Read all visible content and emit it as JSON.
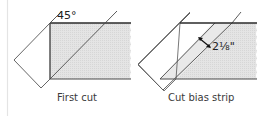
{
  "colors": {
    "line": "#4a4a4a",
    "thick_line": "#2a2a2a",
    "shade": "#e2e2e2",
    "rule": "#e6e6e6"
  },
  "panels": [
    {
      "id": "first-cut",
      "caption": "First cut",
      "angle_label": "45°"
    },
    {
      "id": "cut-bias-strip",
      "caption": "Cut bias strip",
      "dimension_label": "2⅛\""
    }
  ]
}
